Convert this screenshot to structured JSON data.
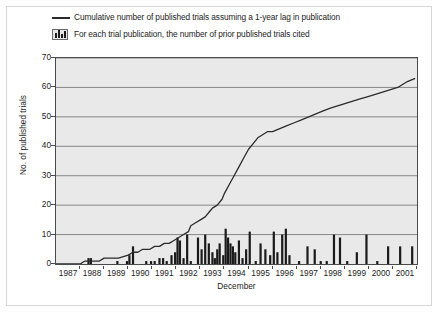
{
  "legend": {
    "items": [
      {
        "key": "line-swatch",
        "label": "Cumulative number of published trials assuming a 1-year lag in publication"
      },
      {
        "key": "bars-swatch",
        "label": "For each trial publication, the number of prior published trials cited"
      }
    ]
  },
  "colors": {
    "plot_background": "#e9e9e9",
    "gridline": "#6e6e6e",
    "axis": "#4a4a4a",
    "line": "#2b2b2b",
    "bar": "#1a1a1a",
    "text": "#1c1c1c",
    "frame": "#d8d8d8"
  },
  "chart_data": {
    "type": "line",
    "title": "",
    "subtitle": "",
    "xlabel": "December",
    "ylabel": "No. of published trials",
    "xlim": [
      1987,
      2002
    ],
    "ylim": [
      0,
      70
    ],
    "yticks": [
      0,
      10,
      20,
      30,
      40,
      50,
      60,
      70
    ],
    "xticks": [
      1987,
      1988,
      1989,
      1990,
      1991,
      1992,
      1993,
      1994,
      1995,
      1996,
      1997,
      1998,
      1999,
      2000,
      2001
    ],
    "grid": "horizontal",
    "legend_position": "above-plot",
    "series": [
      {
        "name": "Cumulative number of published trials assuming a 1-year lag in publication",
        "type": "line",
        "x": [
          1987.0,
          1987.5,
          1988.0,
          1988.2,
          1988.5,
          1988.8,
          1989.0,
          1989.3,
          1989.6,
          1990.0,
          1990.2,
          1990.4,
          1990.6,
          1990.9,
          1991.1,
          1991.3,
          1991.5,
          1991.7,
          1991.9,
          1992.1,
          1992.3,
          1992.5,
          1992.6,
          1992.8,
          1993.0,
          1993.2,
          1993.4,
          1993.5,
          1993.7,
          1993.9,
          1994.0,
          1994.2,
          1994.4,
          1994.6,
          1994.8,
          1995.0,
          1995.2,
          1995.4,
          1995.6,
          1995.8,
          1996.0,
          1996.3,
          1996.6,
          1996.9,
          1997.2,
          1997.5,
          1997.8,
          1998.1,
          1998.4,
          1998.8,
          1999.2,
          1999.6,
          2000.0,
          2000.4,
          2000.8,
          2001.2,
          2001.6,
          2001.9
        ],
        "y": [
          0,
          0,
          0,
          1,
          1,
          1,
          2,
          2,
          2,
          3,
          4,
          4,
          5,
          5,
          6,
          6,
          7,
          7,
          8,
          9,
          10,
          11,
          13,
          14,
          15,
          16,
          18,
          19,
          20,
          22,
          24,
          27,
          30,
          33,
          36,
          39,
          41,
          43,
          44,
          45,
          45,
          46,
          47,
          48,
          49,
          50,
          51,
          52,
          53,
          54,
          55,
          56,
          57,
          58,
          59,
          60,
          62,
          63
        ]
      },
      {
        "name": "For each trial publication, the number of prior published trials cited",
        "type": "bar",
        "x": [
          1988.35,
          1988.45,
          1989.55,
          1989.95,
          1990.05,
          1990.2,
          1990.75,
          1990.95,
          1991.1,
          1991.3,
          1991.45,
          1991.6,
          1991.8,
          1991.95,
          1992.05,
          1992.15,
          1992.3,
          1992.45,
          1992.6,
          1992.9,
          1993.05,
          1993.2,
          1993.35,
          1993.5,
          1993.6,
          1993.7,
          1993.8,
          1993.95,
          1994.05,
          1994.15,
          1994.25,
          1994.35,
          1994.45,
          1994.6,
          1994.75,
          1994.9,
          1995.05,
          1995.3,
          1995.5,
          1995.7,
          1995.9,
          1996.05,
          1996.2,
          1996.4,
          1996.55,
          1996.7,
          1997.1,
          1997.45,
          1997.75,
          1998.0,
          1998.25,
          1998.55,
          1998.8,
          1999.1,
          1999.5,
          1999.9,
          2000.35,
          2000.8,
          2001.3,
          2001.8
        ],
        "y": [
          2,
          2,
          1,
          1,
          3,
          6,
          1,
          1,
          1,
          2,
          2,
          1,
          3,
          4,
          9,
          8,
          2,
          10,
          1,
          9,
          5,
          10,
          7,
          4,
          2,
          5,
          7,
          3,
          12,
          9,
          7,
          6,
          4,
          8,
          2,
          5,
          11,
          1,
          7,
          5,
          3,
          11,
          4,
          10,
          12,
          3,
          1,
          6,
          5,
          1,
          1,
          10,
          9,
          1,
          4,
          10,
          1,
          6,
          6,
          6
        ]
      }
    ]
  }
}
